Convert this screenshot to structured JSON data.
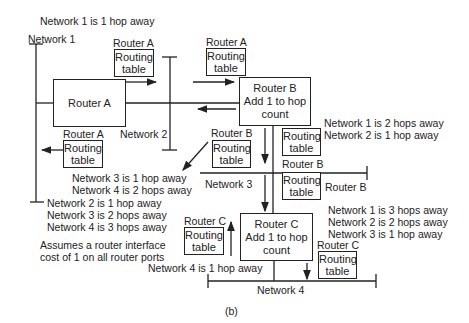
{
  "top_note": "Network 1 is 1 hop away",
  "networks": {
    "n1": "Network 1",
    "n2": "Network 2",
    "n3": "Network 3",
    "n4": "Network 4"
  },
  "routers": {
    "a": {
      "title": "Router A"
    },
    "b": {
      "title": "Router B",
      "action": "Add 1 to hop",
      "action2": "count"
    },
    "c": {
      "title": "Router C",
      "action": "Add 1 to hop",
      "action2": "count"
    }
  },
  "routing_table": {
    "line1": "Routing",
    "line2": "table"
  },
  "table_labels": {
    "a_top": "Router A",
    "a_top_right": "Router A",
    "a_left": "Router A",
    "b_left": "Router B",
    "b_right_under": "Router B",
    "b_right_side": "Router B",
    "c_left": "Router C",
    "c_right": "Router C"
  },
  "messages": {
    "from_b_right": [
      "Network 1 is 2 hops away",
      "Network 2 is 1 hop away"
    ],
    "from_b_left": [
      "Network 3 is 1 hop away",
      "Network 4 is 2 hops away"
    ],
    "from_a_left": [
      "Network 2 is 1 hop away",
      "Network 3 is 2 hops away",
      "Network 4 is 3 hops away"
    ],
    "from_c_right": [
      "Network 1 is 3 hops away",
      "Network 2 is 2 hops away",
      "Network 3 is 1 hop away"
    ],
    "from_c_left": "Network 4 is 1 hop away"
  },
  "assumption": [
    "Assumes a router interface",
    "cost of 1 on all router ports"
  ],
  "caption": "(b)"
}
